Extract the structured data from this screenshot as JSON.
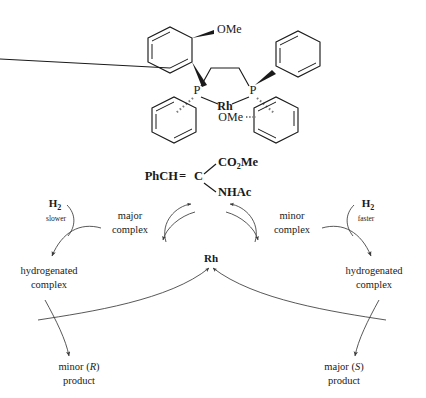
{
  "figure": {
    "catalyst": {
      "name": "rhodium-dipamp-complex",
      "metal_label": "Rh",
      "phosphorus_label": "P",
      "methoxy_label": "OMe",
      "atoms": {
        "p_left": "P",
        "p_right": "P",
        "rh": "Rh",
        "ome_top": "OMe",
        "ome_bottom": "OMe"
      }
    },
    "cycle": {
      "substrate": {
        "left_fragment": "PhCH",
        "double_bond": "=",
        "central_atom": "C",
        "upper_substituent": "CO",
        "upper_substituent_sub": "2",
        "upper_substituent_tail": "Me",
        "lower_substituent": "NHAc"
      },
      "catalyst_node": "Rh",
      "left_complex": {
        "line1": "major",
        "line2": "complex"
      },
      "right_complex": {
        "line1": "minor",
        "line2": "complex"
      },
      "left_reagent": {
        "label": "H",
        "sub": "2",
        "rate": "slower"
      },
      "right_reagent": {
        "label": "H",
        "sub": "2",
        "rate": "faster"
      },
      "left_intermediate": {
        "line1": "hydrogenated",
        "line2": "complex"
      },
      "right_intermediate": {
        "line1": "hydrogenated",
        "line2": "complex"
      },
      "left_product": {
        "prefix": "minor (",
        "stereo": "R",
        "suffix": ")",
        "line2": "product"
      },
      "right_product": {
        "prefix": "major (",
        "stereo": "S",
        "suffix": ")",
        "line2": "product"
      }
    },
    "colors": {
      "ink": "#1a1a1a",
      "arc": "#3a3a3a",
      "hash_bond": "#7d7d7d",
      "background": "#ffffff"
    }
  }
}
